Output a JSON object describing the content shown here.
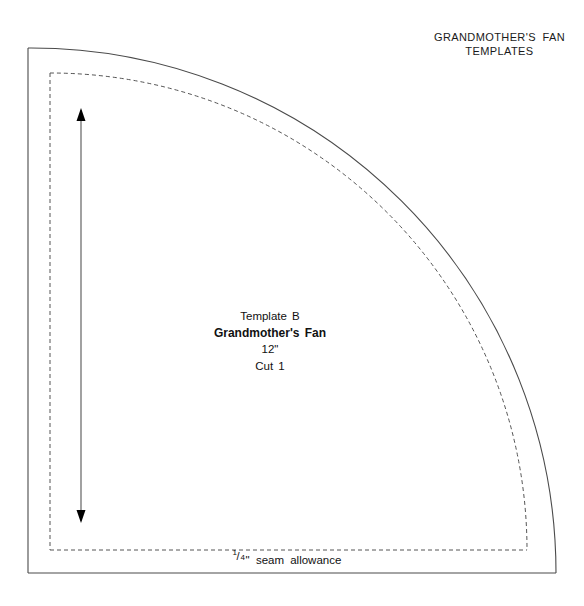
{
  "page": {
    "width": 584,
    "height": 606,
    "background": "#ffffff",
    "line_color": "#4a4a4a",
    "text_color": "#111111"
  },
  "title": {
    "line1": "GRANDMOTHER'S FAN",
    "line2": "TEMPLATES"
  },
  "template_label": {
    "line1": "Template B",
    "line2": "Grandmother's Fan",
    "line3": "12\"",
    "line4": "Cut 1"
  },
  "seam_label": {
    "numerator": "1",
    "slash": "/",
    "denominator": "4",
    "unit": "\"",
    "text": "seam  allowance"
  },
  "geometry": {
    "outer": {
      "corner_x": 28,
      "corner_y": 573,
      "top_y": 48,
      "right_x": 556,
      "radius": 525,
      "style": "solid",
      "description": "quarter-circle template outline with straight left and bottom edges"
    },
    "seam": {
      "corner_x": 50,
      "corner_y": 550,
      "top_y": 73,
      "right_x": 527,
      "radius": 477,
      "style": "dashed",
      "dash": "4 3",
      "description": "dashed stitching line inset by the 1/4 inch seam allowance"
    },
    "arrow": {
      "x": 81,
      "top_y": 108,
      "bottom_y": 523,
      "head_width": 9,
      "head_length": 13,
      "double_headed": true,
      "description": "vertical double-headed dimension arrow spanning the template height"
    }
  }
}
